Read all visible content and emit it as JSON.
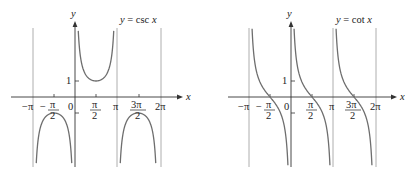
{
  "chart_data": [
    {
      "type": "line",
      "title": "y = csc x",
      "xlabel": "x",
      "ylabel": "y",
      "function": "csc",
      "xlim": [
        -3.3,
        7.0
      ],
      "ylim": [
        -5.5,
        5.5
      ],
      "x_ticks": [
        "-π",
        "-π/2",
        "0",
        "π/2",
        "π",
        "3π/2",
        "2π"
      ],
      "x_tick_values": [
        -3.1416,
        -1.5708,
        0,
        1.5708,
        3.1416,
        4.7124,
        6.2832
      ],
      "y_ticks": [
        "1",
        "-1"
      ],
      "y_tick_values": [
        1,
        -1
      ],
      "asymptotes": [
        "x = -π",
        "x = 0",
        "x = π",
        "x = 2π"
      ],
      "local_extrema": [
        {
          "x": "-π/2",
          "y": -1
        },
        {
          "x": "π/2",
          "y": 1
        },
        {
          "x": "3π/2",
          "y": -1
        }
      ],
      "grid": false
    },
    {
      "type": "line",
      "title": "y = cot x",
      "xlabel": "x",
      "ylabel": "y",
      "function": "cot",
      "xlim": [
        -3.3,
        7.0
      ],
      "ylim": [
        -5.5,
        5.5
      ],
      "x_ticks": [
        "-π",
        "-π/2",
        "0",
        "π/2",
        "π",
        "3π/2",
        "2π"
      ],
      "x_tick_values": [
        -3.1416,
        -1.5708,
        0,
        1.5708,
        3.1416,
        4.7124,
        6.2832
      ],
      "y_ticks": [
        "1",
        "-1"
      ],
      "y_tick_values": [
        1,
        -1
      ],
      "asymptotes": [
        "x = -π",
        "x = 0",
        "x = π",
        "x = 2π"
      ],
      "zeros": [
        "-π/2",
        "π/2",
        "3π/2"
      ],
      "grid": false
    }
  ],
  "left": {
    "title": "y = csc x",
    "y_label": "y",
    "x_label": "x",
    "one": "1",
    "zero": "0",
    "neg_pi": "−π",
    "pi": "π",
    "two_pi": "2π",
    "pi_num": "π",
    "three_pi_num": "3π",
    "den": "2",
    "neg_sign": "−"
  },
  "right": {
    "title": "y = cot x",
    "y_label": "y",
    "x_label": "x",
    "one": "1",
    "zero": "0",
    "neg_pi": "−π",
    "pi": "π",
    "two_pi": "2π",
    "pi_num": "π",
    "three_pi_num": "3π",
    "den": "2",
    "neg_sign": "−"
  }
}
